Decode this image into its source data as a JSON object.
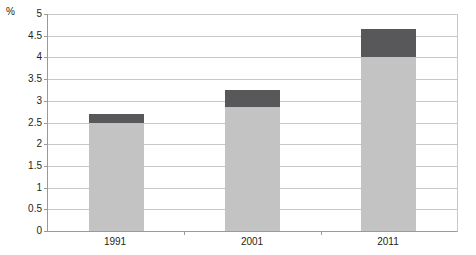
{
  "chart_data": {
    "type": "bar",
    "subtype": "stacked-vertical",
    "title": "",
    "subtitle": "",
    "xlabel": "",
    "ylabel": "%",
    "unit_label": "%",
    "categories": [
      "1991",
      "2001",
      "2011"
    ],
    "series": [
      {
        "name": "lower-segment",
        "color": "#c3c3c3",
        "values": [
          2.5,
          2.85,
          4.0
        ]
      },
      {
        "name": "upper-segment",
        "color": "#58585a",
        "values": [
          0.2,
          0.4,
          0.65
        ]
      }
    ],
    "totals": [
      2.7,
      3.25,
      4.65
    ],
    "ylim": [
      0,
      5
    ],
    "ytick_step": 0.5,
    "yticks": [
      "5",
      "4.5",
      "4",
      "3.5",
      "3",
      "2.5",
      "2",
      "1.5",
      "1",
      "0.5",
      "0"
    ],
    "ytick_values": [
      5,
      4.5,
      4,
      3.5,
      3,
      2.5,
      2,
      1.5,
      1,
      0.5,
      0
    ],
    "grid": {
      "horizontal": true,
      "vertical": false,
      "color": "#c8c8c8"
    },
    "legend": {
      "visible": false,
      "position": "none",
      "entries": []
    },
    "annotations": [],
    "axis_color": "#9a9a9a",
    "background": "#ffffff"
  }
}
